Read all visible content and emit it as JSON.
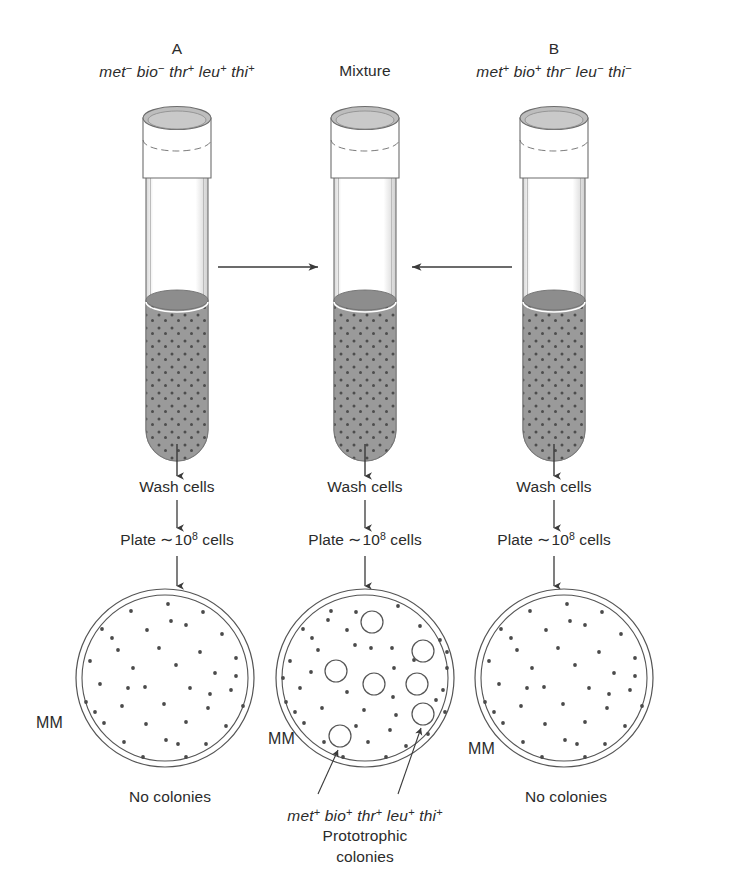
{
  "figure": {
    "title_hidden": "",
    "medium_label": "MM",
    "columns": [
      {
        "id": "strain-a",
        "letter": "A",
        "genotype": [
          {
            "gene": "met",
            "sign": "−"
          },
          {
            "gene": "bio",
            "sign": "−"
          },
          {
            "gene": "thr",
            "sign": "+"
          },
          {
            "gene": "leu",
            "sign": "+"
          },
          {
            "gene": "thi",
            "sign": "+"
          }
        ],
        "steps": [
          "Wash cells",
          "Plate ∼10⁸ cells"
        ],
        "step_wash": "Wash cells",
        "step_plate_prefix": "Plate ",
        "step_plate_tilde": "∼",
        "step_plate_base": "10",
        "step_plate_exp": "8",
        "step_plate_suffix": " cells",
        "plate_label": "MM",
        "result": "No colonies",
        "colony_count": 0
      },
      {
        "id": "mixture",
        "letter": "Mixture",
        "genotype": [],
        "steps": [
          "Wash cells",
          "Plate ∼10⁸ cells"
        ],
        "step_wash": "Wash cells",
        "step_plate_prefix": "Plate ",
        "step_plate_tilde": "∼",
        "step_plate_base": "10",
        "step_plate_exp": "8",
        "step_plate_suffix": " cells",
        "plate_label": "MM",
        "result": "",
        "colony_count": 7,
        "callout_genotype": [
          {
            "gene": "met",
            "sign": "+"
          },
          {
            "gene": "bio",
            "sign": "+"
          },
          {
            "gene": "thr",
            "sign": "+"
          },
          {
            "gene": "leu",
            "sign": "+"
          },
          {
            "gene": "thi",
            "sign": "+"
          }
        ],
        "callout_line1": "Prototrophic",
        "callout_line2": "colonies"
      },
      {
        "id": "strain-b",
        "letter": "B",
        "genotype": [
          {
            "gene": "met",
            "sign": "+"
          },
          {
            "gene": "bio",
            "sign": "+"
          },
          {
            "gene": "thr",
            "sign": "−"
          },
          {
            "gene": "leu",
            "sign": "−"
          },
          {
            "gene": "thi",
            "sign": "−"
          }
        ],
        "steps": [
          "Wash cells",
          "Plate ∼10⁸ cells"
        ],
        "step_wash": "Wash cells",
        "step_plate_prefix": "Plate ",
        "step_plate_tilde": "∼",
        "step_plate_base": "10",
        "step_plate_exp": "8",
        "step_plate_suffix": " cells",
        "plate_label": "MM",
        "result": "No colonies",
        "colony_count": 0
      }
    ],
    "colors": {
      "ink": "#3a3a3a",
      "medium_gray": "#9a9a9a",
      "medium_dark": "#8a8a8a",
      "cap_fill": "#ffffff",
      "cap_top": "#b8b8b8",
      "speck": "#4a4a4a",
      "plate_line": "#555555"
    },
    "colony_positions": [
      {
        "cx": 372,
        "cy": 622,
        "r": 11
      },
      {
        "cx": 423,
        "cy": 651,
        "r": 11
      },
      {
        "cx": 336,
        "cy": 671,
        "r": 11
      },
      {
        "cx": 374,
        "cy": 684,
        "r": 11
      },
      {
        "cx": 417,
        "cy": 684,
        "r": 11
      },
      {
        "cx": 423,
        "cy": 714,
        "r": 11
      },
      {
        "cx": 340,
        "cy": 736,
        "r": 11
      }
    ]
  }
}
